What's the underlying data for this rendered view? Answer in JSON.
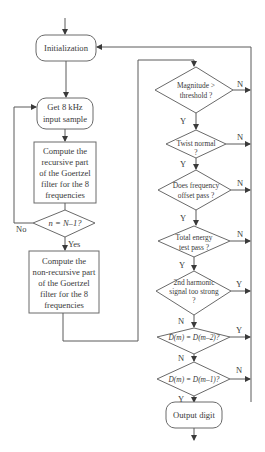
{
  "flowchart": {
    "left_column": {
      "initialization": "Initialization",
      "get_sample": [
        "Get 8 kHz",
        "input sample"
      ],
      "recursive": [
        "Compute the",
        "recursive part",
        "of the Goertzel",
        "filter for the 8",
        "frequencies"
      ],
      "loop_decision": "n = N–1?",
      "loop_no": "No",
      "loop_yes": "Yes",
      "nonrecursive": [
        "Compute the",
        "non-recursive part",
        "of the Goertzel",
        "filter for the 8",
        "frequencies"
      ]
    },
    "right_column": {
      "magnitude": [
        "Magnitude >",
        "threshold ?"
      ],
      "magnitude_no": "N",
      "magnitude_yes": "Y",
      "twist": [
        "Twist normal",
        "?"
      ],
      "twist_no": "N",
      "twist_yes": "Y",
      "freq_offset": [
        "Does frequency",
        "offset pass ?"
      ],
      "freq_offset_no": "N",
      "freq_offset_yes": "Y",
      "total_energy": [
        "Total energy",
        "test pass ?"
      ],
      "total_energy_no": "N",
      "total_energy_yes": "Y",
      "harmonic": [
        "2nd harmonic",
        "signal too strong",
        "?"
      ],
      "harmonic_yes": "Y",
      "harmonic_no": "N",
      "dm2": "D(m) = D(m–2)?",
      "dm2_yes": "Y",
      "dm2_no": "N",
      "dm1": "D(m) = D(m–1)?",
      "dm1_no": "N",
      "dm1_yes": "Y",
      "output": "Output digit"
    }
  }
}
